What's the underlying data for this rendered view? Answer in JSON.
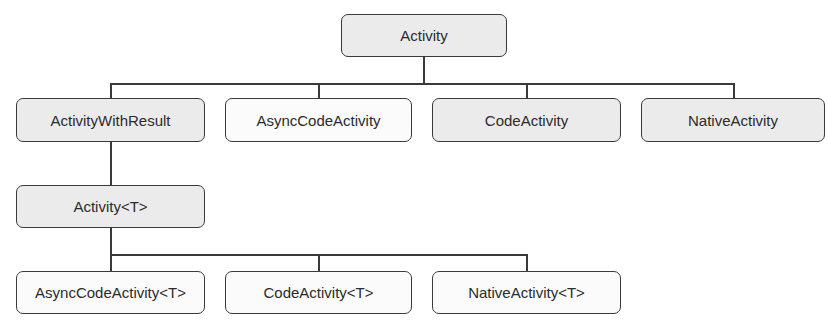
{
  "diagram": {
    "type": "class-hierarchy",
    "nodes": {
      "root": {
        "label": "Activity",
        "style": "filled"
      },
      "activity_with_result": {
        "label": "ActivityWithResult",
        "style": "filled"
      },
      "async_code_activity": {
        "label": "AsyncCodeActivity",
        "style": "plain"
      },
      "code_activity": {
        "label": "CodeActivity",
        "style": "filled"
      },
      "native_activity": {
        "label": "NativeActivity",
        "style": "filled"
      },
      "activity_t": {
        "label": "Activity<T>",
        "style": "filled"
      },
      "async_code_activity_t": {
        "label": "AsyncCodeActivity<T>",
        "style": "plain"
      },
      "code_activity_t": {
        "label": "CodeActivity<T>",
        "style": "plain"
      },
      "native_activity_t": {
        "label": "NativeActivity<T>",
        "style": "plain"
      }
    },
    "edges": [
      [
        "Activity",
        "ActivityWithResult"
      ],
      [
        "Activity",
        "AsyncCodeActivity"
      ],
      [
        "Activity",
        "CodeActivity"
      ],
      [
        "Activity",
        "NativeActivity"
      ],
      [
        "ActivityWithResult",
        "Activity<T>"
      ],
      [
        "Activity<T>",
        "AsyncCodeActivity<T>"
      ],
      [
        "Activity<T>",
        "CodeActivity<T>"
      ],
      [
        "Activity<T>",
        "NativeActivity<T>"
      ]
    ],
    "colors": {
      "filled": "#ebebeb",
      "plain": "#fbfbfb",
      "border": "#3a3a3a"
    }
  }
}
